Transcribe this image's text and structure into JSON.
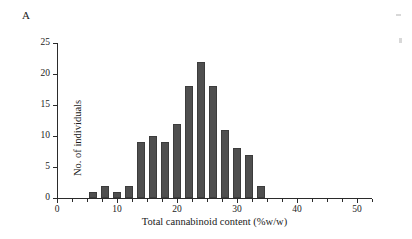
{
  "figure": {
    "panel_label": "A",
    "bar_color": "#4f4f4f",
    "axis_color": "#2b2b2b",
    "background": "#ffffff"
  },
  "chart_data": {
    "type": "bar",
    "title": "",
    "subtitle": "",
    "xlabel": "Total cannabinoid content (%w/w)",
    "ylabel": "No. of individuals",
    "xlim": [
      0,
      52.5
    ],
    "ylim": [
      0,
      25
    ],
    "grid": false,
    "legend": null,
    "bar_width_units": 1.35,
    "x_ticks": [
      0,
      10,
      20,
      30,
      40,
      50
    ],
    "x_tick_labels": [
      "0",
      "10",
      "20",
      "30",
      "40",
      "50"
    ],
    "x_minor_ticks": [
      2.5,
      5,
      7.5,
      12.5,
      15,
      17.5,
      22.5,
      25,
      27.5,
      32.5,
      35,
      37.5,
      42.5,
      45,
      47.5,
      52.5
    ],
    "y_ticks": [
      0,
      5,
      10,
      15,
      20,
      25
    ],
    "y_tick_labels": [
      "0",
      "5",
      "10",
      "15",
      "20",
      "25"
    ],
    "categories": [
      6,
      8,
      10,
      12,
      14,
      16,
      18,
      20,
      22,
      24,
      26,
      28,
      30,
      32,
      34
    ],
    "values": [
      1,
      2,
      1,
      2,
      9,
      10,
      9,
      12,
      18,
      22,
      18,
      11,
      8,
      7,
      2
    ],
    "annotations": [
      "A"
    ]
  }
}
